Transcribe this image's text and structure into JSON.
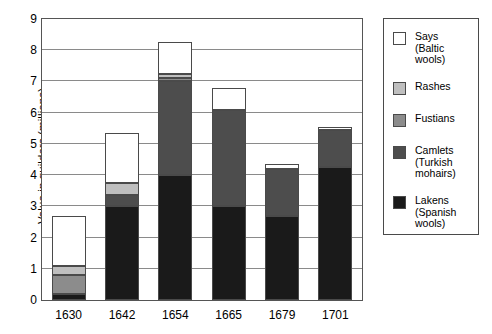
{
  "chart_data": {
    "type": "bar",
    "subtype": "stacked-bar",
    "title": "",
    "xlabel": "",
    "ylabel": "Value in guilders (millions)",
    "ylim": [
      0,
      9
    ],
    "ytick_step": 1,
    "yticks": [
      "0",
      "1",
      "2",
      "3",
      "4",
      "5",
      "6",
      "7",
      "8",
      "9"
    ],
    "grid": true,
    "grid_axis": "y",
    "legend_position": "right",
    "categories": [
      "1630",
      "1642",
      "1654",
      "1665",
      "1679",
      "1701"
    ],
    "series": [
      {
        "name": "Lakens (Spanish wools)",
        "short_name": "Lakens",
        "color": "#1a1a1a",
        "values": [
          0.2,
          3.0,
          4.0,
          3.0,
          2.7,
          4.25
        ]
      },
      {
        "name": "Camlets (Turkish mohairs)",
        "short_name": "Camlets",
        "color": "#4d4d4d",
        "values": [
          0.0,
          0.35,
          3.0,
          3.1,
          1.5,
          1.2
        ]
      },
      {
        "name": "Fustians",
        "short_name": "Fustians",
        "color": "#8c8c8c",
        "values": [
          0.6,
          0.0,
          0.1,
          0.0,
          0.0,
          0.0
        ]
      },
      {
        "name": "Rashes",
        "short_name": "Rashes",
        "color": "#bfbfbf",
        "values": [
          0.3,
          0.4,
          0.15,
          0.0,
          0.0,
          0.0
        ]
      },
      {
        "name": "Says (Baltic wools)",
        "short_name": "Says",
        "color": "#ffffff",
        "values": [
          1.6,
          1.6,
          1.0,
          0.7,
          0.15,
          0.1
        ]
      }
    ],
    "totals": [
      2.7,
      5.35,
      8.25,
      6.8,
      4.35,
      5.55
    ]
  },
  "legend": {
    "items": [
      {
        "label": "Says\n(Baltic\nwools)",
        "swatch_color": "#ffffff",
        "icon": "legend-swatch-says"
      },
      {
        "label": "Rashes",
        "swatch_color": "#bfbfbf",
        "icon": "legend-swatch-rashes"
      },
      {
        "label": "Fustians",
        "swatch_color": "#8c8c8c",
        "icon": "legend-swatch-fustians"
      },
      {
        "label": "Camlets\n(Turkish\nmohairs)",
        "swatch_color": "#4d4d4d",
        "icon": "legend-swatch-camlets"
      },
      {
        "label": "Lakens\n(Spanish\nwools)",
        "swatch_color": "#1a1a1a",
        "icon": "legend-swatch-lakens"
      }
    ]
  }
}
